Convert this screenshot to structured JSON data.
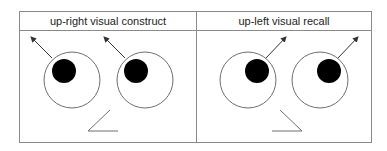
{
  "panels": [
    {
      "title": "up-right visual construct",
      "gaze": "up-left",
      "eyes": [
        {
          "cx": 72,
          "cy": 80,
          "r": 28,
          "pupil": {
            "cx": 64,
            "cy": 71,
            "r": 12
          },
          "arrow": {
            "x1": 52,
            "y1": 58,
            "x2": 31,
            "y2": 37
          }
        },
        {
          "cx": 145,
          "cy": 80,
          "r": 28,
          "pupil": {
            "cx": 136,
            "cy": 71,
            "r": 12
          },
          "arrow": {
            "x1": 125,
            "y1": 58,
            "x2": 104,
            "y2": 37
          }
        }
      ],
      "nose": "110,110 88,131 118,131"
    },
    {
      "title": "up-left visual recall",
      "gaze": "up-right",
      "eyes": [
        {
          "cx": 248,
          "cy": 80,
          "r": 28,
          "pupil": {
            "cx": 257,
            "cy": 71,
            "r": 12
          },
          "arrow": {
            "x1": 266,
            "y1": 58,
            "x2": 286,
            "y2": 37
          }
        },
        {
          "cx": 320,
          "cy": 80,
          "r": 28,
          "pupil": {
            "cx": 329,
            "cy": 71,
            "r": 12
          },
          "arrow": {
            "x1": 338,
            "y1": 58,
            "x2": 358,
            "y2": 37
          }
        }
      ],
      "nose": "280,110 302,131 272,131"
    }
  ],
  "colors": {
    "line": "#6e6e6e",
    "pupil": "#000000",
    "border": "#8a8a8a"
  }
}
